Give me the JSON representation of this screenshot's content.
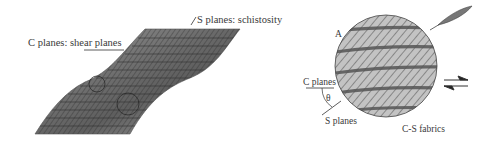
{
  "left_panel": {
    "label_c": "C planes: shear planes",
    "label_s": "S planes: schistosity"
  },
  "right_panel": {
    "label_a": "A",
    "label_c": "C planes",
    "label_s": "S planes",
    "label_theta": "θ",
    "caption": "C-S fabrics"
  },
  "colors": {
    "sheet_fill": "#8a8a8a",
    "sheet_dark": "#444444",
    "circle_fill": "#bdbdbd",
    "band_dark": "#555555",
    "lens_fill": "#777777",
    "line": "#333333"
  }
}
